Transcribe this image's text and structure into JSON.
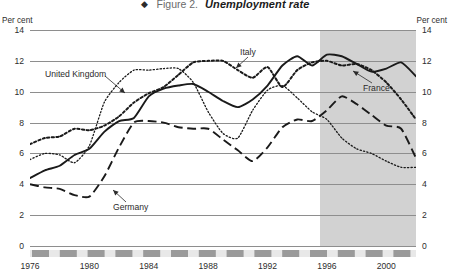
{
  "header": {
    "diamond_glyph": "◆",
    "figure_number": "Figure 2.",
    "figure_title": "Unemployment rate"
  },
  "axis": {
    "unit_left": "Per cent",
    "unit_right": "Per cent"
  },
  "chart_data": {
    "type": "line",
    "title": "Unemployment rate",
    "xlabel": "",
    "ylabel": "Per cent",
    "ylim": [
      0,
      14
    ],
    "xlim": [
      1976,
      2002
    ],
    "ytick_labels": [
      "14",
      "12",
      "10",
      "8",
      "6",
      "4",
      "2",
      "0"
    ],
    "ytick_values": [
      14,
      12,
      10,
      8,
      6,
      4,
      2,
      0
    ],
    "xtick_labels": [
      "1976",
      "1980",
      "1984",
      "1988",
      "1992",
      "1996",
      "2000"
    ],
    "xtick_values": [
      1976,
      1980,
      1984,
      1988,
      1992,
      1996,
      2000
    ],
    "grid": true,
    "legend_position": "inline-annotations",
    "shaded_region": {
      "label": "projection",
      "from": 1995.5,
      "to": 2002,
      "color": "#d2d2d2"
    },
    "x": [
      1976,
      1977,
      1978,
      1979,
      1980,
      1981,
      1982,
      1983,
      1984,
      1985,
      1986,
      1987,
      1988,
      1989,
      1990,
      1991,
      1992,
      1993,
      1994,
      1995,
      1996,
      1997,
      1998,
      1999,
      2000,
      2001,
      2002
    ],
    "series": [
      {
        "name": "France",
        "style": "solid",
        "color": "#1a1a1a",
        "values": [
          4.4,
          4.9,
          5.2,
          5.9,
          6.3,
          7.4,
          8.1,
          8.3,
          9.7,
          10.2,
          10.4,
          10.5,
          10.0,
          9.4,
          9.0,
          9.5,
          10.4,
          11.7,
          12.3,
          11.7,
          12.4,
          12.3,
          11.8,
          11.3,
          11.5,
          11.9,
          11.0
        ]
      },
      {
        "name": "Germany",
        "style": "long-dash",
        "color": "#1a1a1a",
        "values": [
          4.0,
          3.8,
          3.7,
          3.3,
          3.2,
          4.5,
          6.4,
          8.0,
          8.1,
          8.0,
          7.7,
          7.6,
          7.6,
          6.9,
          6.2,
          5.5,
          6.4,
          7.7,
          8.2,
          8.1,
          8.8,
          9.7,
          9.2,
          8.5,
          7.8,
          7.6,
          5.7
        ]
      },
      {
        "name": "Italy",
        "style": "dotted-bold",
        "color": "#1a1a1a",
        "values": [
          6.6,
          7.0,
          7.1,
          7.6,
          7.5,
          7.8,
          8.4,
          9.3,
          9.9,
          10.3,
          11.1,
          11.9,
          12.0,
          12.0,
          11.4,
          10.9,
          11.6,
          10.3,
          11.4,
          11.9,
          12.0,
          11.7,
          11.8,
          11.4,
          10.6,
          9.5,
          8.2
        ]
      },
      {
        "name": "United Kingdom",
        "style": "dotted-fine",
        "color": "#1a1a1a",
        "values": [
          5.6,
          6.0,
          5.9,
          5.4,
          6.5,
          9.3,
          10.6,
          11.4,
          11.4,
          11.5,
          11.5,
          10.6,
          8.7,
          7.3,
          7.0,
          8.8,
          10.1,
          10.4,
          9.6,
          8.7,
          8.2,
          7.0,
          6.3,
          6.0,
          5.5,
          5.1,
          5.1
        ]
      }
    ],
    "annotations": [
      {
        "text": "United Kingdom",
        "series": "United Kingdom"
      },
      {
        "text": "Italy",
        "series": "Italy"
      },
      {
        "text": "France",
        "series": "France"
      },
      {
        "text": "Germany",
        "series": "Germany"
      }
    ]
  }
}
